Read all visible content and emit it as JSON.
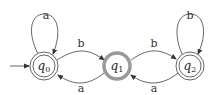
{
  "diagram": {
    "type": "finite-automaton",
    "states": [
      {
        "id": "q0",
        "base": "q",
        "sub": "0",
        "accepting": true,
        "initial": true,
        "highlighted": false
      },
      {
        "id": "q1",
        "base": "q",
        "sub": "1",
        "accepting": false,
        "initial": false,
        "highlighted": true
      },
      {
        "id": "q2",
        "base": "q",
        "sub": "2",
        "accepting": true,
        "initial": false,
        "highlighted": false
      }
    ],
    "transitions": [
      {
        "from": "q0",
        "to": "q0",
        "label": "a"
      },
      {
        "from": "q0",
        "to": "q1",
        "label": "b"
      },
      {
        "from": "q1",
        "to": "q0",
        "label": "a"
      },
      {
        "from": "q1",
        "to": "q2",
        "label": "b"
      },
      {
        "from": "q2",
        "to": "q1",
        "label": "a"
      },
      {
        "from": "q2",
        "to": "q2",
        "label": "b"
      }
    ],
    "colors": {
      "edge": "#555555",
      "highlight_ring": "#9a9a9a"
    }
  }
}
